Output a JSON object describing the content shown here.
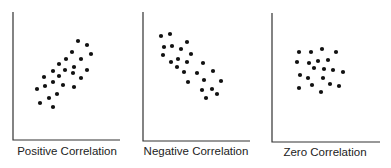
{
  "chart_data": [
    {
      "type": "scatter",
      "title": "Positive Correlation",
      "xlabel": "",
      "ylabel": "",
      "grid": false,
      "axes": {
        "x0": 13,
        "y_top": 12,
        "y_base": 140,
        "x_end": 120
      },
      "label_pos": {
        "x": 67,
        "y": 155
      },
      "points": [
        [
          78,
          41
        ],
        [
          87,
          45
        ],
        [
          72,
          52
        ],
        [
          91,
          54
        ],
        [
          66,
          59
        ],
        [
          81,
          59
        ],
        [
          59,
          64
        ],
        [
          74,
          67
        ],
        [
          53,
          71
        ],
        [
          65,
          70
        ],
        [
          87,
          70
        ],
        [
          44,
          77
        ],
        [
          59,
          76
        ],
        [
          73,
          73
        ],
        [
          81,
          78
        ],
        [
          53,
          82
        ],
        [
          45,
          86
        ],
        [
          63,
          85
        ],
        [
          74,
          87
        ],
        [
          37,
          89
        ],
        [
          57,
          94
        ],
        [
          49,
          98
        ],
        [
          40,
          103
        ],
        [
          53,
          107
        ]
      ]
    },
    {
      "type": "scatter",
      "title": "Negative Correlation",
      "xlabel": "",
      "ylabel": "",
      "grid": false,
      "axes": {
        "x0": 143,
        "y_top": 12,
        "y_base": 141,
        "x_end": 250
      },
      "label_pos": {
        "x": 196,
        "y": 155
      },
      "points": [
        [
          161,
          36
        ],
        [
          170,
          34
        ],
        [
          164,
          47
        ],
        [
          172,
          46
        ],
        [
          181,
          49
        ],
        [
          187,
          42
        ],
        [
          163,
          55
        ],
        [
          178,
          59
        ],
        [
          191,
          54
        ],
        [
          171,
          62
        ],
        [
          177,
          67
        ],
        [
          187,
          62
        ],
        [
          203,
          63
        ],
        [
          184,
          72
        ],
        [
          197,
          73
        ],
        [
          213,
          71
        ],
        [
          188,
          82
        ],
        [
          204,
          80
        ],
        [
          221,
          81
        ],
        [
          202,
          90
        ],
        [
          212,
          89
        ],
        [
          217,
          94
        ],
        [
          206,
          98
        ]
      ]
    },
    {
      "type": "scatter",
      "title": "Zero Correlation",
      "xlabel": "",
      "ylabel": "",
      "grid": false,
      "axes": {
        "x0": 272,
        "y_top": 13,
        "y_base": 142,
        "x_end": 380
      },
      "label_pos": {
        "x": 325,
        "y": 156
      },
      "points": [
        [
          299,
          52
        ],
        [
          311,
          52
        ],
        [
          322,
          49
        ],
        [
          336,
          52
        ],
        [
          297,
          62
        ],
        [
          309,
          63
        ],
        [
          318,
          61
        ],
        [
          328,
          60
        ],
        [
          314,
          68
        ],
        [
          324,
          69
        ],
        [
          333,
          70
        ],
        [
          343,
          72
        ],
        [
          300,
          75
        ],
        [
          308,
          78
        ],
        [
          323,
          78
        ],
        [
          299,
          88
        ],
        [
          312,
          85
        ],
        [
          330,
          84
        ],
        [
          339,
          86
        ],
        [
          321,
          92
        ]
      ]
    }
  ]
}
